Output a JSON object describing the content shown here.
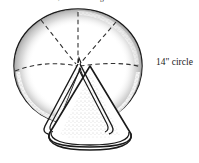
{
  "figure": {
    "title_caption": "round, cut into wedges",
    "circle_label": "14\" circle",
    "colors": {
      "background": "#ffffff",
      "ink": "#1a1a1a",
      "dashed": "#3a3a3a",
      "stipple": "#9a9a9a"
    },
    "geometry": {
      "circle_center_x": 78,
      "circle_center_y": 67,
      "circle_radius_x": 64,
      "circle_radius_y": 58,
      "wedge_apex_x": 78,
      "wedge_apex_y": 67,
      "cone_base_center_x": 90,
      "cone_base_center_y": 143
    },
    "elements": {
      "circle_name": "fabric-circle",
      "wedge_name": "cut-wedge",
      "cone_name": "folded-cone",
      "fold_lines_name": "dashed-fold-lines"
    }
  }
}
